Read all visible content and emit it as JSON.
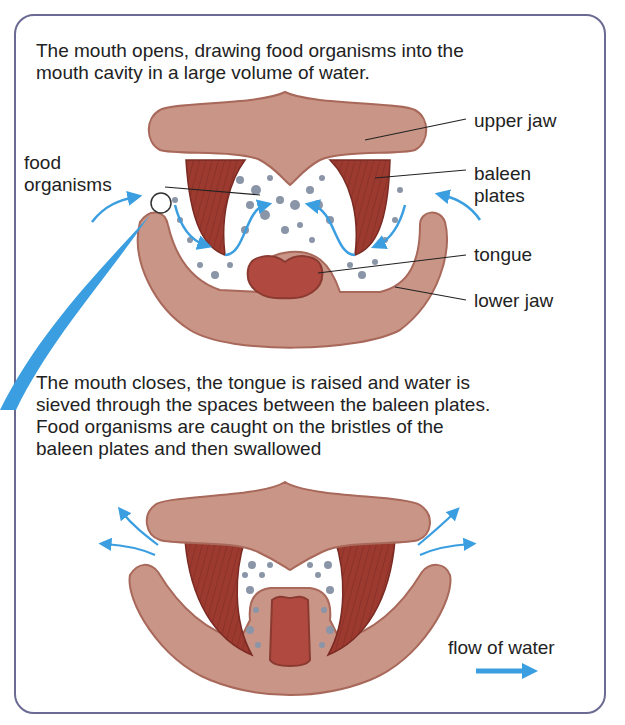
{
  "figure": {
    "panel_top": {
      "caption_lines": [
        "The mouth opens, drawing food organisms into the",
        "mouth cavity in a large volume of water."
      ],
      "labels": {
        "food_organisms_line1": "food",
        "food_organisms_line2": "organisms",
        "upper_jaw": "upper jaw",
        "baleen_line1": "baleen",
        "baleen_line2": "plates",
        "tongue": "tongue",
        "lower_jaw": "lower jaw"
      }
    },
    "panel_bottom": {
      "caption_lines": [
        "The mouth closes, the tongue is raised and water is",
        "sieved through the spaces between the baleen plates.",
        "Food organisms are caught on the bristles of the",
        "baleen plates and then swallowed"
      ],
      "legend": {
        "flow_label": "flow of water",
        "icon": "right-arrow-icon"
      }
    },
    "colors": {
      "frame": "#6b6a92",
      "jaw": "#c99587",
      "jaw_edge": "#a8685a",
      "baleen": "#9c3a30",
      "tongue": "#b04a40",
      "particles": "#8a95a8",
      "water_arrow": "#3a9ee0",
      "text": "#222222"
    }
  }
}
